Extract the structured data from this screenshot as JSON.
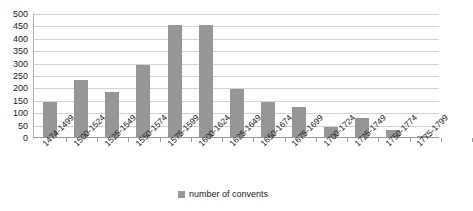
{
  "chart_data": {
    "type": "bar",
    "title": "",
    "xlabel": "",
    "ylabel": "",
    "ylim": [
      0,
      500
    ],
    "ytick_step": 50,
    "yticks": [
      500,
      450,
      400,
      350,
      300,
      250,
      200,
      150,
      100,
      50,
      0
    ],
    "grid": true,
    "legend_position": "bottom",
    "series_name": "number of convents",
    "bar_color": "#969696",
    "gridline_color": "#d2d2d2",
    "axis_color": "#9a9a9a",
    "categories": [
      "1474-1499",
      "1500-1524",
      "1525-1549",
      "1550-1574",
      "1575-1599",
      "1600-1624",
      "1625-1649",
      "1650-1674",
      "1675-1699",
      "1700-1724",
      "1725-1749",
      "1750-1774",
      "1775-1799"
    ],
    "values": [
      140,
      230,
      180,
      290,
      450,
      450,
      195,
      140,
      120,
      40,
      75,
      30,
      3
    ],
    "series": [
      {
        "name": "number of convents",
        "values": [
          140,
          230,
          180,
          290,
          450,
          450,
          195,
          140,
          120,
          40,
          75,
          30,
          3
        ]
      }
    ]
  },
  "legend": {
    "label": "number of convents"
  }
}
